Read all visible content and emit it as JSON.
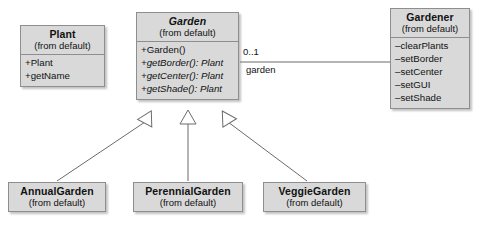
{
  "diagram": {
    "type": "uml-class-diagram",
    "classes": [
      {
        "id": "plant",
        "name": "Plant",
        "package": "(from default)",
        "abstract": false,
        "members": [
          {
            "text": "+Plant",
            "visibility": "public",
            "abstract": false
          },
          {
            "text": "+getName",
            "visibility": "public",
            "abstract": false
          }
        ]
      },
      {
        "id": "garden",
        "name": "Garden",
        "package": "(from default)",
        "abstract": true,
        "members": [
          {
            "text": "+Garden()",
            "visibility": "public",
            "abstract": false
          },
          {
            "text": "+getBorder(): Plant",
            "visibility": "public",
            "abstract": true
          },
          {
            "text": "+getCenter(): Plant",
            "visibility": "public",
            "abstract": true
          },
          {
            "text": "+getShade(): Plant",
            "visibility": "public",
            "abstract": true
          }
        ]
      },
      {
        "id": "gardener",
        "name": "Gardener",
        "package": "(from default)",
        "abstract": false,
        "members": [
          {
            "text": "–clearPlants",
            "visibility": "private",
            "abstract": false
          },
          {
            "text": "–setBorder",
            "visibility": "private",
            "abstract": false
          },
          {
            "text": "–setCenter",
            "visibility": "private",
            "abstract": false
          },
          {
            "text": "–setGUI",
            "visibility": "private",
            "abstract": false
          },
          {
            "text": "–setShade",
            "visibility": "private",
            "abstract": false
          }
        ]
      },
      {
        "id": "annual-garden",
        "name": "AnnualGarden",
        "package": "(from default)",
        "abstract": false,
        "members": []
      },
      {
        "id": "perennial-garden",
        "name": "PerennialGarden",
        "package": "(from default)",
        "abstract": false,
        "members": []
      },
      {
        "id": "veggie-garden",
        "name": "VeggieGarden",
        "package": "(from default)",
        "abstract": false,
        "members": []
      }
    ],
    "association": {
      "from": "garden",
      "to": "gardener",
      "multiplicity": "0..1",
      "role": "garden"
    },
    "generalizations": [
      {
        "from": "annual-garden",
        "to": "garden"
      },
      {
        "from": "perennial-garden",
        "to": "garden"
      },
      {
        "from": "veggie-garden",
        "to": "garden"
      }
    ],
    "colors": {
      "box_fill": "#d9d9d9",
      "box_border": "#8e8e8e",
      "line": "#6b6b6b",
      "text": "#111111",
      "background": "#ffffff"
    }
  }
}
